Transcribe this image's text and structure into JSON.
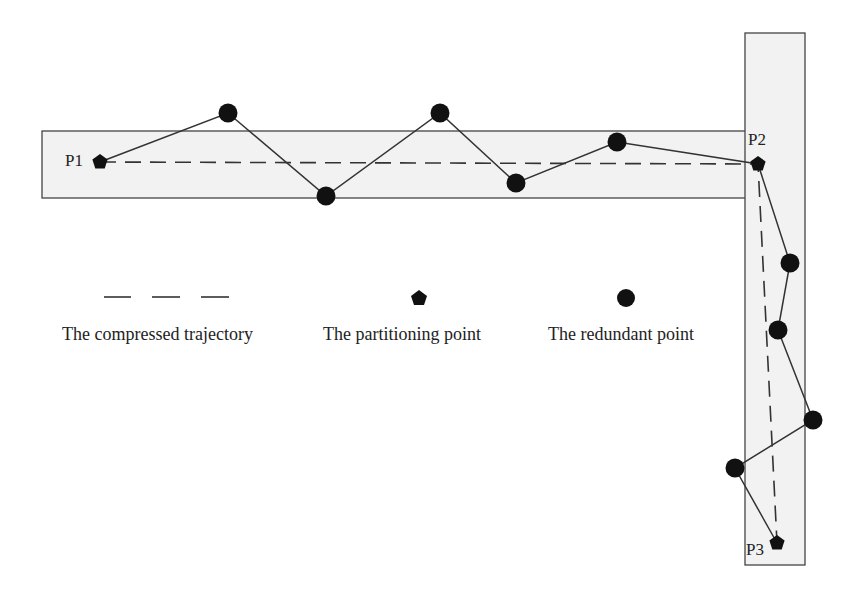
{
  "diagram": {
    "type": "trajectory-compression",
    "colors": {
      "band_fill": "#f2f2f2",
      "band_stroke": "#444444",
      "ink": "#111111",
      "line": "#333333",
      "text": "#222222"
    },
    "bands": [
      {
        "name": "horizontal-band",
        "x": 42,
        "y": 131,
        "w": 706,
        "h": 67
      },
      {
        "name": "vertical-band",
        "x": 745,
        "y": 33,
        "w": 60,
        "h": 532
      }
    ],
    "partitioning_points": [
      {
        "id": "P1",
        "label": "P1",
        "x": 100,
        "y": 162,
        "label_x": 65,
        "label_y": 166
      },
      {
        "id": "P2",
        "label": "P2",
        "x": 758,
        "y": 164,
        "label_x": 748,
        "label_y": 145
      },
      {
        "id": "P3",
        "label": "P3",
        "x": 777,
        "y": 543,
        "label_x": 746,
        "label_y": 555
      }
    ],
    "redundant_points": [
      {
        "x": 228,
        "y": 113
      },
      {
        "x": 326,
        "y": 196
      },
      {
        "x": 440,
        "y": 113
      },
      {
        "x": 516,
        "y": 183
      },
      {
        "x": 617,
        "y": 142
      },
      {
        "x": 790,
        "y": 263
      },
      {
        "x": 778,
        "y": 330
      },
      {
        "x": 813,
        "y": 420
      },
      {
        "x": 735,
        "y": 468
      }
    ],
    "original_trajectory": [
      [
        100,
        162
      ],
      [
        228,
        113
      ],
      [
        326,
        196
      ],
      [
        440,
        113
      ],
      [
        516,
        183
      ],
      [
        617,
        142
      ],
      [
        758,
        164
      ],
      [
        790,
        263
      ],
      [
        778,
        330
      ],
      [
        813,
        420
      ],
      [
        735,
        468
      ],
      [
        777,
        543
      ]
    ],
    "compressed_trajectory": [
      [
        100,
        162
      ],
      [
        758,
        164
      ],
      [
        777,
        543
      ]
    ]
  },
  "legend": {
    "items": [
      {
        "name": "compressed-trajectory",
        "label": "The compressed trajectory",
        "symbol": "dashed-line"
      },
      {
        "name": "partitioning-point",
        "label": "The partitioning point",
        "symbol": "pentagon"
      },
      {
        "name": "redundant-point",
        "label": "The redundant point",
        "symbol": "circle"
      }
    ]
  }
}
